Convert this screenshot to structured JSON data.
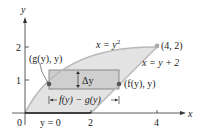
{
  "figure": {
    "axes": {
      "x_label": "x",
      "y_label": "y",
      "origin_label": "0",
      "x_ticks": [
        "2",
        "4"
      ],
      "y_ticks": [
        "1",
        "2"
      ]
    },
    "curves": {
      "parabola_label": "x = y",
      "parabola_exp": "2",
      "line_label": "x = y + 2"
    },
    "points": {
      "top_point": "(4, 2)",
      "left_point": "(g(y), y)",
      "right_point": "(f(y), y)"
    },
    "strip": {
      "height_label": "Δy",
      "width_label": "f(y) − g(y)"
    },
    "bottom_label": "y = 0",
    "colors": {
      "region_fill": "#e3e3e3",
      "strip_fill": "#cfcfcf",
      "curve": "#b8b8b8",
      "axis": "#333333",
      "point": "#555555"
    }
  }
}
